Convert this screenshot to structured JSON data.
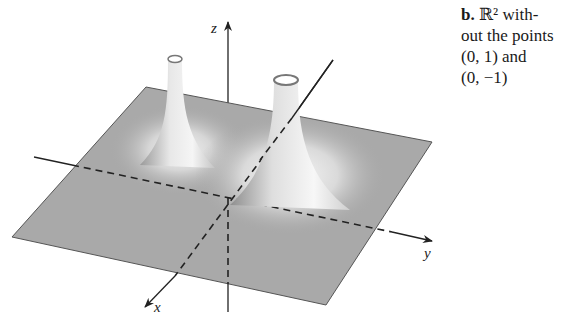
{
  "figure": {
    "part_label": "b.",
    "caption_line1": "ℝ² with-",
    "caption_line2": "out the points",
    "caption_line3": "(0, 1) and",
    "caption_line4": "(0, −1)",
    "axes": {
      "x": "x",
      "y": "y",
      "z": "z"
    },
    "colors": {
      "plane": "#a9a9a9",
      "plane_edge": "#555555",
      "axis": "#222222",
      "background": "#ffffff"
    },
    "surfaces": [
      {
        "name": "spike-left",
        "point": "(0, 1)"
      },
      {
        "name": "spike-right",
        "point": "(0, -1)"
      }
    ]
  }
}
